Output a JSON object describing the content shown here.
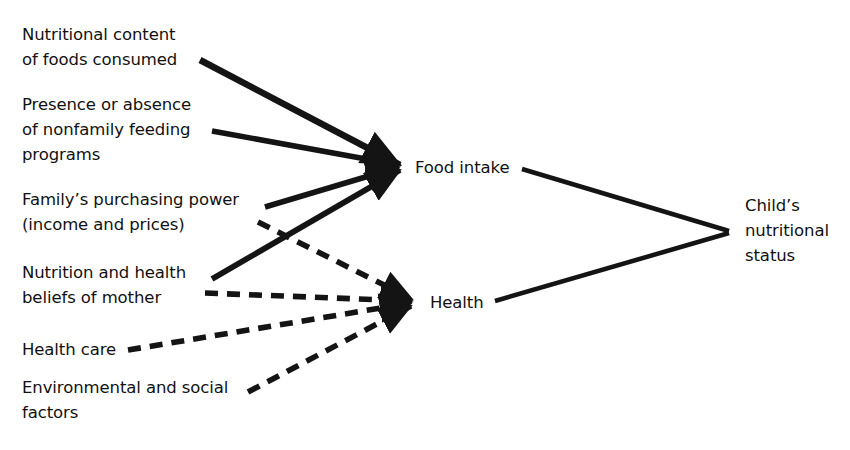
{
  "diagram": {
    "background_color": "#ffffff",
    "line_color": "#141414",
    "text_color": "#111111",
    "inputs": [
      {
        "id": "nutritional-content",
        "label": "Nutritional content\nof foods consumed"
      },
      {
        "id": "feeding-programs",
        "label": "Presence or absence\nof nonfamily feeding\nprograms"
      },
      {
        "id": "purchasing-power",
        "label": "Family’s purchasing power\n(income and prices)"
      },
      {
        "id": "mother-beliefs",
        "label": "Nutrition and health\nbeliefs of mother"
      },
      {
        "id": "health-care",
        "label": "Health care"
      },
      {
        "id": "environmental",
        "label": "Environmental and social\nfactors"
      }
    ],
    "intermediates": [
      {
        "id": "food-intake",
        "label": "Food intake"
      },
      {
        "id": "health",
        "label": "Health"
      }
    ],
    "outcome": {
      "id": "child-status",
      "label": "Child’s\nnutritional\nstatus"
    },
    "edges": [
      {
        "from": "nutritional-content",
        "to": "food-intake",
        "style": "solid"
      },
      {
        "from": "feeding-programs",
        "to": "food-intake",
        "style": "solid"
      },
      {
        "from": "purchasing-power",
        "to": "food-intake",
        "style": "solid"
      },
      {
        "from": "mother-beliefs",
        "to": "food-intake",
        "style": "solid"
      },
      {
        "from": "purchasing-power",
        "to": "health",
        "style": "dashed"
      },
      {
        "from": "mother-beliefs",
        "to": "health",
        "style": "dashed"
      },
      {
        "from": "health-care",
        "to": "health",
        "style": "dashed"
      },
      {
        "from": "environmental",
        "to": "health",
        "style": "dashed"
      },
      {
        "from": "food-intake",
        "to": "child-status",
        "style": "solid"
      },
      {
        "from": "health",
        "to": "child-status",
        "style": "solid"
      }
    ]
  }
}
